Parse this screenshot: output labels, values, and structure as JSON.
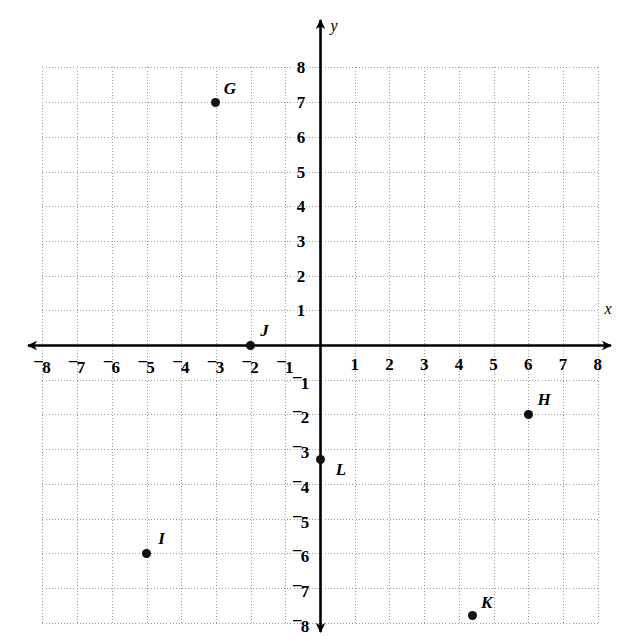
{
  "figure": {
    "kind": "coordinate-plane",
    "x_axis_name": "x",
    "y_axis_name": "y"
  },
  "chart_data": {
    "type": "scatter",
    "title": "",
    "xlabel": "x",
    "ylabel": "y",
    "xlim": [
      -8,
      8
    ],
    "ylim": [
      -8,
      8
    ],
    "grid": true,
    "grid_step": 1,
    "legend": "none",
    "x_tick_labels": [
      "–8",
      "–7",
      "–6",
      "–5",
      "–4",
      "–3",
      "–2",
      "–1",
      "1",
      "2",
      "3",
      "4",
      "5",
      "6",
      "7",
      "8"
    ],
    "y_tick_labels": [
      "8",
      "7",
      "6",
      "5",
      "4",
      "3",
      "2",
      "1",
      "–1",
      "–2",
      "–3",
      "–4",
      "–5",
      "–6",
      "–7",
      "–8"
    ],
    "points": [
      {
        "label": "G",
        "x": -3,
        "y": 7,
        "label_dx": 14,
        "label_dy": -14
      },
      {
        "label": "J",
        "x": -2,
        "y": 0,
        "label_dx": 14,
        "label_dy": -15
      },
      {
        "label": "H",
        "x": 6,
        "y": -2,
        "label_dx": 16,
        "label_dy": -15
      },
      {
        "label": "L",
        "x": 0,
        "y": -3.3,
        "label_dx": 21,
        "label_dy": 9
      },
      {
        "label": "I",
        "x": -5,
        "y": -6,
        "label_dx": 15,
        "label_dy": -15
      },
      {
        "label": "K",
        "x": 4.4,
        "y": -7.8,
        "label_dx": 14,
        "label_dy": -14
      }
    ]
  },
  "axis_ticks": {
    "x_values": [
      -8,
      -7,
      -6,
      -5,
      -4,
      -3,
      -2,
      -1,
      1,
      2,
      3,
      4,
      5,
      6,
      7,
      8
    ],
    "y_values": [
      8,
      7,
      6,
      5,
      4,
      3,
      2,
      1,
      -1,
      -2,
      -3,
      -4,
      -5,
      -6,
      -7,
      -8
    ]
  },
  "style": {
    "grid_color": "#9a9a9a",
    "axis_color": "#000000",
    "point_color": "#111111",
    "background": "#ffffff"
  }
}
